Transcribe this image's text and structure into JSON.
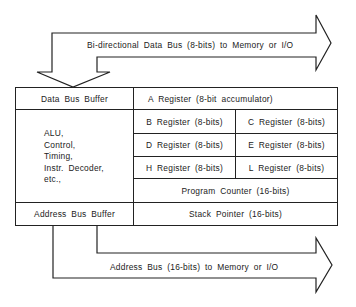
{
  "diagram": {
    "data_bus": {
      "label": "Bi-directional Data Bus (8-bits) to Memory or I/O"
    },
    "address_bus": {
      "label": "Address Bus (16-bits) to Memory or I/O"
    },
    "left_column": {
      "data_bus_buffer": "Data Bus Buffer",
      "control_lines": [
        "ALU,",
        "Control,",
        "Timing,",
        "Instr. Decoder,",
        "etc.,"
      ],
      "address_bus_buffer": "Address Bus Buffer"
    },
    "registers": {
      "a": "A Register (8-bit accumulator)",
      "pairs": [
        [
          "B Register (8-bits)",
          "C Register (8-bits)"
        ],
        [
          "D Register (8-bits)",
          "E Register (8-bits)"
        ],
        [
          "H Register (8-bits)",
          "L Register (8-bits)"
        ]
      ],
      "program_counter": "Program Counter (16-bits)",
      "stack_pointer": "Stack Pointer (16-bits)"
    }
  },
  "colors": {
    "line": "#222222",
    "text": "#222222",
    "background": "#ffffff"
  }
}
